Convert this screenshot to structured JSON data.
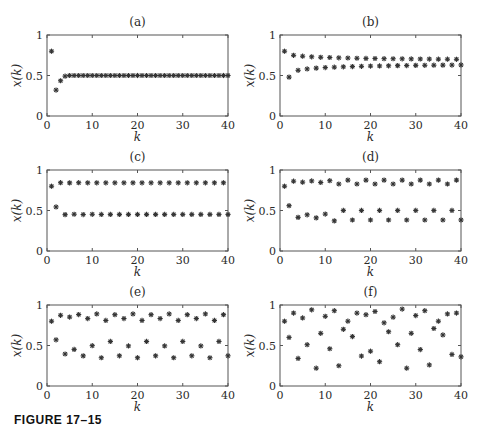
{
  "figure": {
    "caption": "FIGURE 17–15"
  },
  "chart_data": [
    {
      "type": "scatter",
      "title": "(a)",
      "xlabel": "k",
      "ylabel": "x(k)",
      "xlim": [
        0,
        40
      ],
      "ylim": [
        0,
        1
      ],
      "xticks": [
        0,
        10,
        20,
        30,
        40
      ],
      "yticks": [
        0,
        0.5,
        1
      ],
      "ytick_labels": [
        "0",
        "0.5",
        "1"
      ],
      "marker": "asterisk",
      "grid": false,
      "x": [
        1,
        2,
        3,
        4,
        5,
        6,
        7,
        8,
        9,
        10,
        11,
        12,
        13,
        14,
        15,
        16,
        17,
        18,
        19,
        20,
        21,
        22,
        23,
        24,
        25,
        26,
        27,
        28,
        29,
        30,
        31,
        32,
        33,
        34,
        35,
        36,
        37,
        38,
        39,
        40
      ],
      "y": [
        0.8,
        0.32,
        0.435,
        0.492,
        0.5,
        0.5,
        0.5,
        0.5,
        0.5,
        0.5,
        0.5,
        0.5,
        0.5,
        0.5,
        0.5,
        0.5,
        0.5,
        0.5,
        0.5,
        0.5,
        0.5,
        0.5,
        0.5,
        0.5,
        0.5,
        0.5,
        0.5,
        0.5,
        0.5,
        0.5,
        0.5,
        0.5,
        0.5,
        0.5,
        0.5,
        0.5,
        0.5,
        0.5,
        0.5,
        0.5
      ]
    },
    {
      "type": "scatter",
      "title": "(b)",
      "xlabel": "k",
      "ylabel": "x(k)",
      "xlim": [
        0,
        40
      ],
      "ylim": [
        0,
        1
      ],
      "xticks": [
        0,
        10,
        20,
        30,
        40
      ],
      "yticks": [
        0,
        0.5,
        1
      ],
      "ytick_labels": [
        "0",
        "0.5",
        "1"
      ],
      "marker": "asterisk",
      "grid": false,
      "x": [
        1,
        2,
        3,
        4,
        5,
        6,
        7,
        8,
        9,
        10,
        11,
        12,
        13,
        14,
        15,
        16,
        17,
        18,
        19,
        20,
        21,
        22,
        23,
        24,
        25,
        26,
        27,
        28,
        29,
        30,
        31,
        32,
        33,
        34,
        35,
        36,
        37,
        38,
        39,
        40
      ],
      "y": [
        0.8,
        0.48,
        0.749,
        0.564,
        0.738,
        0.581,
        0.731,
        0.591,
        0.725,
        0.598,
        0.722,
        0.603,
        0.718,
        0.607,
        0.716,
        0.61,
        0.713,
        0.613,
        0.711,
        0.616,
        0.71,
        0.618,
        0.708,
        0.62,
        0.707,
        0.622,
        0.706,
        0.623,
        0.705,
        0.625,
        0.704,
        0.626,
        0.703,
        0.627,
        0.702,
        0.628,
        0.701,
        0.629,
        0.7,
        0.63
      ]
    },
    {
      "type": "scatter",
      "title": "(c)",
      "xlabel": "k",
      "ylabel": "x(k)",
      "xlim": [
        0,
        40
      ],
      "ylim": [
        0,
        1
      ],
      "xticks": [
        0,
        10,
        20,
        30,
        40
      ],
      "yticks": [
        0,
        0.5,
        1
      ],
      "ytick_labels": [
        "0",
        "0.5",
        "1"
      ],
      "marker": "asterisk",
      "grid": false,
      "x": [
        1,
        2,
        3,
        4,
        5,
        6,
        7,
        8,
        9,
        10,
        11,
        12,
        13,
        14,
        15,
        16,
        17,
        18,
        19,
        20,
        21,
        22,
        23,
        24,
        25,
        26,
        27,
        28,
        29,
        30,
        31,
        32,
        33,
        34,
        35,
        36,
        37,
        38,
        39,
        40
      ],
      "y": [
        0.8,
        0.544,
        0.843,
        0.449,
        0.841,
        0.454,
        0.843,
        0.45,
        0.842,
        0.453,
        0.842,
        0.451,
        0.842,
        0.452,
        0.842,
        0.452,
        0.842,
        0.452,
        0.842,
        0.452,
        0.842,
        0.452,
        0.842,
        0.452,
        0.842,
        0.452,
        0.842,
        0.452,
        0.842,
        0.452,
        0.842,
        0.452,
        0.842,
        0.452,
        0.842,
        0.452,
        0.842,
        0.452,
        0.842,
        0.452
      ]
    },
    {
      "type": "scatter",
      "title": "(d)",
      "xlabel": "k",
      "ylabel": "x(k)",
      "xlim": [
        0,
        40
      ],
      "ylim": [
        0,
        1
      ],
      "xticks": [
        0,
        10,
        20,
        30,
        40
      ],
      "yticks": [
        0,
        0.5,
        1
      ],
      "ytick_labels": [
        "0",
        "0.5",
        "1"
      ],
      "marker": "asterisk",
      "grid": false,
      "x": [
        1,
        2,
        3,
        4,
        5,
        6,
        7,
        8,
        9,
        10,
        11,
        12,
        13,
        14,
        15,
        16,
        17,
        18,
        19,
        20,
        21,
        22,
        23,
        24,
        25,
        26,
        27,
        28,
        29,
        30,
        31,
        32,
        33,
        34,
        35,
        36,
        37,
        38,
        39,
        40
      ],
      "y": [
        0.8,
        0.56,
        0.862,
        0.415,
        0.85,
        0.447,
        0.865,
        0.409,
        0.846,
        0.456,
        0.868,
        0.372,
        0.827,
        0.501,
        0.875,
        0.383,
        0.827,
        0.501,
        0.875,
        0.383,
        0.827,
        0.501,
        0.875,
        0.383,
        0.827,
        0.501,
        0.875,
        0.383,
        0.827,
        0.501,
        0.875,
        0.383,
        0.827,
        0.501,
        0.875,
        0.383,
        0.827,
        0.501,
        0.875,
        0.383
      ]
    },
    {
      "type": "scatter",
      "title": "(e)",
      "xlabel": "k",
      "ylabel": "x(k)",
      "xlim": [
        0,
        40
      ],
      "ylim": [
        0,
        1
      ],
      "xticks": [
        0,
        10,
        20,
        30,
        40
      ],
      "yticks": [
        0,
        0.5,
        1
      ],
      "ytick_labels": [
        "0",
        "0.5",
        "1"
      ],
      "marker": "asterisk",
      "grid": false,
      "x": [
        1,
        2,
        3,
        4,
        5,
        6,
        7,
        8,
        9,
        10,
        11,
        12,
        13,
        14,
        15,
        16,
        17,
        18,
        19,
        20,
        21,
        22,
        23,
        24,
        25,
        26,
        27,
        28,
        29,
        30,
        31,
        32,
        33,
        34,
        35,
        36,
        37,
        38,
        39,
        40
      ],
      "y": [
        0.8,
        0.57,
        0.873,
        0.395,
        0.851,
        0.452,
        0.882,
        0.372,
        0.832,
        0.498,
        0.89,
        0.349,
        0.809,
        0.55,
        0.881,
        0.373,
        0.833,
        0.495,
        0.89,
        0.349,
        0.809,
        0.55,
        0.881,
        0.373,
        0.833,
        0.495,
        0.89,
        0.349,
        0.809,
        0.55,
        0.881,
        0.373,
        0.833,
        0.495,
        0.89,
        0.349,
        0.809,
        0.55,
        0.881,
        0.373
      ]
    },
    {
      "type": "scatter",
      "title": "(f)",
      "xlabel": "k",
      "ylabel": "x(k)",
      "xlim": [
        0,
        40
      ],
      "ylim": [
        0,
        1
      ],
      "xticks": [
        0,
        10,
        20,
        30,
        40
      ],
      "yticks": [
        0,
        0.5,
        1
      ],
      "ytick_labels": [
        "0",
        "0.5",
        "1"
      ],
      "marker": "asterisk",
      "grid": false,
      "x": [
        1,
        2,
        3,
        4,
        5,
        6,
        7,
        8,
        9,
        10,
        11,
        12,
        13,
        14,
        15,
        16,
        17,
        18,
        19,
        20,
        21,
        22,
        23,
        24,
        25,
        26,
        27,
        28,
        29,
        30,
        31,
        32,
        33,
        34,
        35,
        36,
        37,
        38,
        39,
        40
      ],
      "y": [
        0.8,
        0.6,
        0.9,
        0.34,
        0.84,
        0.51,
        0.94,
        0.22,
        0.65,
        0.86,
        0.46,
        0.93,
        0.25,
        0.7,
        0.8,
        0.61,
        0.9,
        0.37,
        0.88,
        0.43,
        0.92,
        0.3,
        0.78,
        0.67,
        0.85,
        0.51,
        0.95,
        0.22,
        0.65,
        0.87,
        0.45,
        0.93,
        0.26,
        0.71,
        0.8,
        0.63,
        0.89,
        0.39,
        0.9,
        0.36
      ]
    }
  ]
}
